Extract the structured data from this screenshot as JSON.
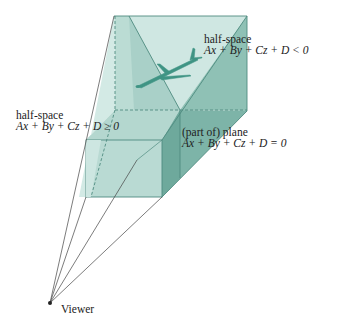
{
  "figure": {
    "colors": {
      "background": "#ffffff",
      "light_face": "#cfe7e2",
      "mid_face": "#aed3cb",
      "dark_face": "#7fb6aa",
      "edge": "#4f8b80",
      "ray": "#444444",
      "airplane": "#3f9484"
    },
    "labels": {
      "left_halfspace": {
        "title": "half-space",
        "equation": "Ax + By + Cz + D ≥ 0"
      },
      "right_halfspace": {
        "title": "half-space",
        "equation": "Ax + By + Cz + D < 0"
      },
      "plane": {
        "title": "(part of) plane",
        "equation": "Ax + By + Cz + D = 0"
      },
      "viewer": "Viewer"
    },
    "icons": {
      "airplane": "airplane-icon",
      "viewer_point": "viewer-dot-icon"
    }
  }
}
